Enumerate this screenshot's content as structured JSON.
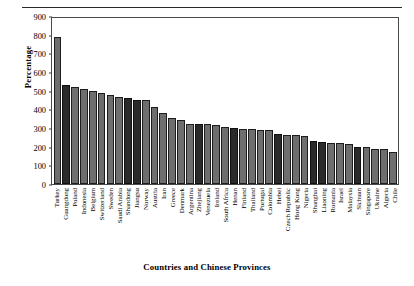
{
  "chart_data": {
    "type": "bar",
    "title": "",
    "xlabel": "Countries and Chinese Provinces",
    "ylabel": "Percentage",
    "ylim": [
      0,
      900
    ],
    "ytick_values": [
      0,
      100,
      200,
      300,
      400,
      500,
      600,
      700,
      800,
      900
    ],
    "ytick_labels": [
      "0",
      "100",
      "200",
      "300",
      "400",
      "500",
      "600",
      "700",
      "800",
      "900"
    ],
    "grid": false,
    "legend": null,
    "bar_colors": {
      "country": "#6e6e6e",
      "chinese_province": "#2a2a2a",
      "outline": "#1d1d1d"
    },
    "categories": [
      "Turkey",
      "Guangdong",
      "Poland",
      "Indonesia",
      "Belgium",
      "Switzerland",
      "Sweden",
      "Saudi Arabia",
      "Shandong",
      "Jiangsu",
      "Norway",
      "Austria",
      "Iran",
      "Greece",
      "Denmark",
      "Argentina",
      "Zhejiang",
      "Venezuela",
      "Ireland",
      "South Africa",
      "Henan",
      "Finland",
      "Thailand",
      "Portugal",
      "Colombia",
      "Hebei",
      "Czech Republic",
      "Hong Kong",
      "Nigeria",
      "Shanghai",
      "Liaoning",
      "Romania",
      "Israel",
      "Malaysia",
      "Sichuan",
      "Singapore",
      "Ukraine",
      "Algeria",
      "Chile"
    ],
    "values": [
      790,
      528,
      521,
      511,
      496,
      487,
      479,
      466,
      462,
      451,
      448,
      415,
      383,
      352,
      341,
      324,
      322,
      320,
      318,
      303,
      300,
      296,
      294,
      291,
      289,
      268,
      265,
      262,
      258,
      230,
      225,
      222,
      219,
      216,
      200,
      198,
      190,
      186,
      172
    ],
    "highlighted": [
      "Guangdong",
      "Shandong",
      "Jiangsu",
      "Zhejiang",
      "Henan",
      "Hebei",
      "Shanghai",
      "Liaoning",
      "Sichuan"
    ]
  }
}
